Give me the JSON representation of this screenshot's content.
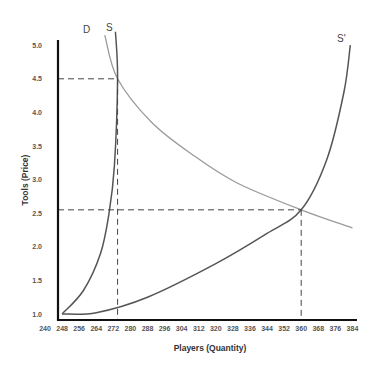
{
  "chart_data": {
    "type": "line",
    "title": "",
    "xlabel": "Players (Quantity)",
    "ylabel": "Tools  (Price)",
    "xlim": [
      240,
      384
    ],
    "ylim": [
      1.0,
      5.0
    ],
    "x_ticks": [
      "240",
      "248",
      "256",
      "264",
      "272",
      "280",
      "288",
      "296",
      "304",
      "312",
      "320",
      "328",
      "336",
      "344",
      "352",
      "360",
      "368",
      "376",
      "384"
    ],
    "y_ticks": [
      "1.0",
      "1.5",
      "2.0",
      "2.5",
      "3.0",
      "3.5",
      "4.0",
      "4.5",
      "5.0"
    ],
    "grid": false,
    "legend": null,
    "series": [
      {
        "name": "D",
        "color": "#9a9a9a",
        "points": [
          [
            268,
            5.15
          ],
          [
            274,
            4.5
          ],
          [
            290,
            3.85
          ],
          [
            310,
            3.35
          ],
          [
            330,
            2.95
          ],
          [
            360,
            2.55
          ],
          [
            384,
            2.28
          ]
        ]
      },
      {
        "name": "S",
        "color": "#555555",
        "points": [
          [
            248,
            1.0
          ],
          [
            258,
            1.35
          ],
          [
            266,
            1.9
          ],
          [
            270,
            2.5
          ],
          [
            272.5,
            3.2
          ],
          [
            274,
            4.5
          ],
          [
            273,
            5.2
          ]
        ]
      },
      {
        "name": "S'",
        "color": "#555555",
        "points": [
          [
            248,
            1.0
          ],
          [
            264,
            1.02
          ],
          [
            288,
            1.25
          ],
          [
            320,
            1.75
          ],
          [
            344,
            2.2
          ],
          [
            360,
            2.55
          ],
          [
            372,
            3.3
          ],
          [
            380,
            4.3
          ],
          [
            383,
            5.0
          ]
        ]
      }
    ],
    "annotations": [
      {
        "type": "dashed-guide",
        "point": [
          274,
          4.5
        ],
        "label": "Equilibrium D/S"
      },
      {
        "type": "dashed-guide",
        "point": [
          360,
          2.55
        ],
        "label": "Equilibrium D/S'"
      }
    ]
  },
  "labels": {
    "d": "D",
    "s": "S",
    "s_prime": "S'",
    "xlabel": "Players (Quantity)",
    "ylabel": "Tools  (Price)"
  }
}
